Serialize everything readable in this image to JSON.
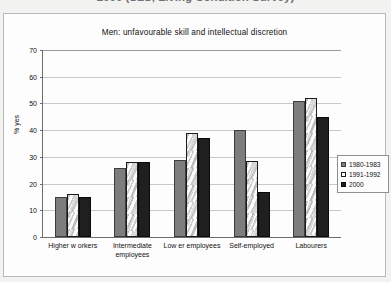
{
  "caption": {
    "text": "2000 (SLS, Living Condition Survey)"
  },
  "legend_position": "right-inside",
  "ylabel": "% yes",
  "chart_data": {
    "type": "bar",
    "title": "Men: unfavourable skill and intellectual discretion",
    "xlabel": "",
    "ylabel": "% yes",
    "ylim": [
      0,
      70
    ],
    "yticks": [
      0,
      10,
      20,
      30,
      40,
      50,
      60,
      70
    ],
    "grid": true,
    "legend_position": "right",
    "categories": [
      "Higher w orkers",
      "Intermediate\nemployees",
      "Low er employees",
      "Self-employed",
      "Labourers"
    ],
    "series": [
      {
        "name": "1980-1983",
        "color": "#7d7d7d",
        "values": [
          15,
          26,
          29,
          40,
          51
        ]
      },
      {
        "name": "1991-1992",
        "color": "#ffffff",
        "values": [
          16,
          28,
          39,
          28.5,
          52
        ]
      },
      {
        "name": "2000",
        "color": "#1f1f1f",
        "values": [
          15,
          28,
          37,
          17,
          45
        ]
      }
    ]
  }
}
